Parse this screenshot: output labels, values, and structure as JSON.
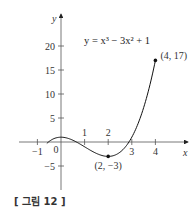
{
  "chart_data": {
    "type": "line",
    "title": "",
    "equation": "y = x³ − 3x² + 1",
    "function": "x^3 - 3x^2 + 1",
    "xlabel": "x",
    "ylabel": "y",
    "x_ticks": [
      -1,
      0,
      1,
      2,
      3,
      4
    ],
    "x_tick_labels": [
      "−1",
      "0",
      "1",
      "2",
      "3",
      "4"
    ],
    "y_ticks": [
      -5,
      5,
      10,
      15,
      20
    ],
    "y_tick_labels": [
      "−5",
      "5",
      "10",
      "15",
      "20"
    ],
    "xlim": [
      -1.8,
      5.4
    ],
    "ylim": [
      -10,
      26
    ],
    "domain": [
      -0.6,
      4
    ],
    "grid": false,
    "legend": null,
    "points": [
      {
        "x": 2,
        "y": -3,
        "label": "(2, −3)"
      },
      {
        "x": 4,
        "y": 17,
        "label": "(4, 17)"
      }
    ]
  },
  "caption": "[ 그림 12 ]"
}
